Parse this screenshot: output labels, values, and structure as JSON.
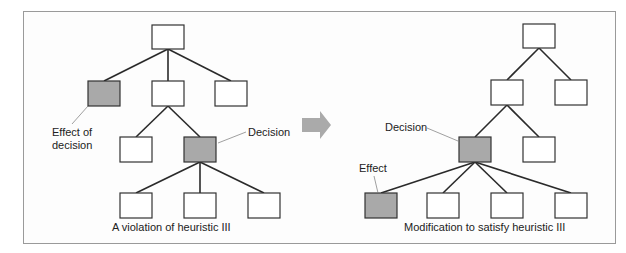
{
  "figure": {
    "left_panel": {
      "caption": "A violation of heuristic III",
      "annotations": {
        "effect_line1": "Effect of",
        "effect_line2": "decision",
        "decision": "Decision"
      }
    },
    "right_panel": {
      "caption": "Modification to satisfy heuristic III",
      "annotations": {
        "effect": "Effect",
        "decision": "Decision"
      }
    },
    "transition_arrow": "right-arrow"
  },
  "colors": {
    "highlight_fill": "#a9a9a9",
    "box_stroke": "#333333",
    "arrow_fill": "#aaaaaa",
    "frame": "#9a9a9a"
  }
}
